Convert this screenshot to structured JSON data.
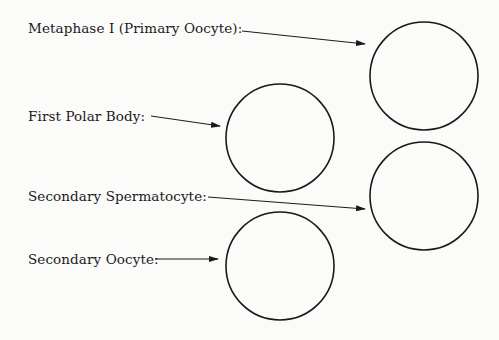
{
  "labels": [
    {
      "text": "Metaphase I (Primary Oocyte):",
      "x": 28,
      "y": 20
    },
    {
      "text": "First Polar Body:",
      "x": 28,
      "y": 108
    },
    {
      "text": "Secondary Spermatocyte:",
      "x": 28,
      "y": 188
    },
    {
      "text": "Secondary Oocyte:",
      "x": 28,
      "y": 251
    }
  ],
  "circles": [
    {
      "name": "metaphase-i-circle",
      "cx": 424,
      "cy": 76,
      "r": 54
    },
    {
      "name": "first-polar-body-circle",
      "cx": 280,
      "cy": 138,
      "r": 54
    },
    {
      "name": "secondary-spermatocyte-circle",
      "cx": 424,
      "cy": 196,
      "r": 54
    },
    {
      "name": "secondary-oocyte-circle",
      "cx": 280,
      "cy": 266,
      "r": 54
    }
  ],
  "arrows": [
    {
      "name": "metaphase-i-arrow",
      "x1": 242,
      "y1": 31,
      "x2": 365,
      "y2": 44
    },
    {
      "name": "first-polar-body-arrow",
      "x1": 151,
      "y1": 116,
      "x2": 220,
      "y2": 126
    },
    {
      "name": "secondary-spermatocyte-arrow",
      "x1": 208,
      "y1": 197,
      "x2": 365,
      "y2": 209
    },
    {
      "name": "secondary-oocyte-arrow",
      "x1": 155,
      "y1": 259,
      "x2": 218,
      "y2": 259
    }
  ],
  "colors": {
    "stroke": "#1a1a1a",
    "background": "#fbfbfa"
  }
}
